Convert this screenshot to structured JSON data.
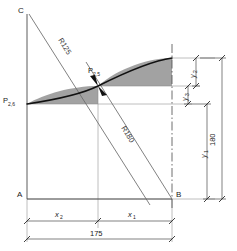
{
  "diagram": {
    "type": "engineering-construction-drawing",
    "corner_labels": {
      "top_left": "C",
      "bottom_left": "A",
      "bottom_right": "B"
    },
    "points": [
      {
        "name": "P-2-5",
        "base": "P",
        "subscript": "2,5"
      },
      {
        "name": "P-2-6",
        "base": "P",
        "subscript": "2,6"
      }
    ],
    "radii": [
      {
        "name": "radius-upper",
        "label": "R125"
      },
      {
        "name": "radius-lower",
        "label": "R180"
      }
    ],
    "vertical_dimensions": [
      {
        "name": "y2",
        "base": "y",
        "subscript": "2"
      },
      {
        "name": "y3",
        "base": "y",
        "subscript": "3"
      },
      {
        "name": "y1",
        "base": "y",
        "subscript": "1"
      },
      {
        "name": "total-height",
        "label": "180"
      }
    ],
    "horizontal_dimensions": [
      {
        "name": "x2",
        "base": "x",
        "subscript": "2"
      },
      {
        "name": "x1",
        "base": "x",
        "subscript": "1"
      },
      {
        "name": "total-width",
        "label": "175"
      }
    ],
    "colors": {
      "line": "#4a4a4a",
      "heavy_line": "#111111",
      "shade": "#9d9d9d",
      "thin": "#8a8a8a"
    }
  }
}
